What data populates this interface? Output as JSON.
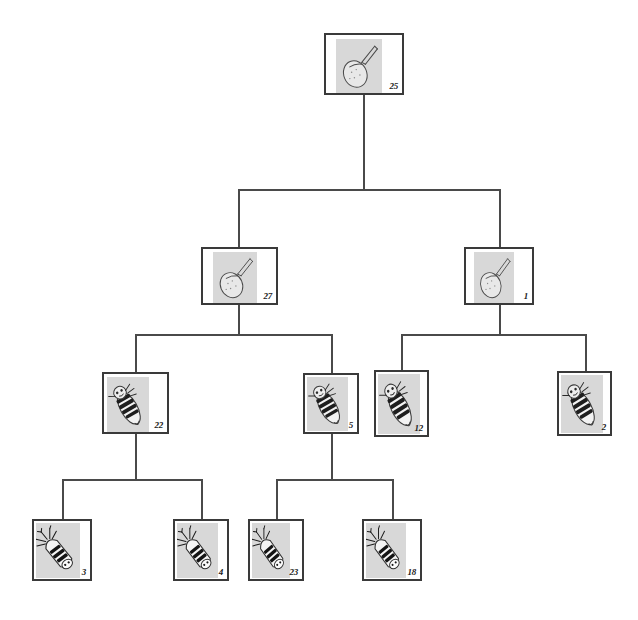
{
  "diagram": {
    "type": "hierarchical-tree",
    "background_color": "#ffffff",
    "line_color": "#4a4a4a",
    "box_border_color": "#3a3a3a",
    "thumb_background_color": "#d8d8d8",
    "levels": 4,
    "node_count": 11
  },
  "nodes": [
    {
      "id": "n25",
      "label": "25",
      "level": 0,
      "icon": "specimen-thumbnail-pupa",
      "x": 324,
      "y": 33,
      "w": 80,
      "h": 62,
      "thumb_x": 10,
      "thumb_y": 4,
      "thumb_w": 46,
      "thumb_h": 54,
      "parent": null
    },
    {
      "id": "n27",
      "label": "27",
      "level": 1,
      "icon": "specimen-thumbnail-pupa",
      "x": 201,
      "y": 247,
      "w": 77,
      "h": 58,
      "thumb_x": 10,
      "thumb_y": 3,
      "thumb_w": 44,
      "thumb_h": 51,
      "parent": "n25"
    },
    {
      "id": "n1",
      "label": "1",
      "level": 1,
      "icon": "specimen-thumbnail-pupa",
      "x": 464,
      "y": 247,
      "w": 70,
      "h": 58,
      "thumb_x": 8,
      "thumb_y": 3,
      "thumb_w": 40,
      "thumb_h": 51,
      "parent": "n25"
    },
    {
      "id": "n22",
      "label": "22",
      "level": 2,
      "icon": "specimen-thumbnail-larva",
      "x": 102,
      "y": 372,
      "w": 67,
      "h": 62,
      "thumb_x": 3,
      "thumb_y": 3,
      "thumb_w": 42,
      "thumb_h": 55,
      "parent": "n27"
    },
    {
      "id": "n5",
      "label": "5",
      "level": 2,
      "icon": "specimen-thumbnail-larva",
      "x": 303,
      "y": 373,
      "w": 56,
      "h": 61,
      "thumb_x": 2,
      "thumb_y": 2,
      "thumb_w": 41,
      "thumb_h": 54,
      "parent": "n27"
    },
    {
      "id": "n12",
      "label": "12",
      "level": 2,
      "icon": "specimen-thumbnail-larva",
      "x": 374,
      "y": 370,
      "w": 55,
      "h": 67,
      "thumb_x": 2,
      "thumb_y": 2,
      "thumb_w": 42,
      "thumb_h": 60,
      "parent": "n1"
    },
    {
      "id": "n2",
      "label": "2",
      "level": 2,
      "icon": "specimen-thumbnail-larva",
      "x": 557,
      "y": 371,
      "w": 55,
      "h": 65,
      "thumb_x": 2,
      "thumb_y": 2,
      "thumb_w": 42,
      "thumb_h": 58,
      "parent": "n1"
    },
    {
      "id": "n3",
      "label": "3",
      "level": 3,
      "icon": "specimen-thumbnail-bomb-larva",
      "x": 32,
      "y": 519,
      "w": 60,
      "h": 62,
      "thumb_x": 2,
      "thumb_y": 2,
      "thumb_w": 44,
      "thumb_h": 55,
      "parent": "n22"
    },
    {
      "id": "n4",
      "label": "4",
      "level": 3,
      "icon": "specimen-thumbnail-bomb-larva",
      "x": 173,
      "y": 519,
      "w": 56,
      "h": 62,
      "thumb_x": 2,
      "thumb_y": 2,
      "thumb_w": 41,
      "thumb_h": 55,
      "parent": "n22"
    },
    {
      "id": "n23",
      "label": "23",
      "level": 3,
      "icon": "specimen-thumbnail-bomb-larva",
      "x": 248,
      "y": 519,
      "w": 56,
      "h": 62,
      "thumb_x": 2,
      "thumb_y": 2,
      "thumb_w": 38,
      "thumb_h": 55,
      "parent": "n5"
    },
    {
      "id": "n18",
      "label": "18",
      "level": 3,
      "icon": "specimen-thumbnail-bomb-larva",
      "x": 362,
      "y": 519,
      "w": 60,
      "h": 62,
      "thumb_x": 2,
      "thumb_y": 2,
      "thumb_w": 40,
      "thumb_h": 55,
      "parent": "n5"
    }
  ],
  "edges": [
    {
      "name": "root-stem",
      "orient": "v",
      "x": 363,
      "y": 95,
      "len": 95
    },
    {
      "name": "level1-bar",
      "orient": "h",
      "x": 238,
      "y": 189,
      "len": 262
    },
    {
      "name": "to-n27",
      "orient": "v",
      "x": 238,
      "y": 189,
      "len": 58
    },
    {
      "name": "to-n1",
      "orient": "v",
      "x": 499,
      "y": 189,
      "len": 58
    },
    {
      "name": "n27-stem",
      "orient": "v",
      "x": 238,
      "y": 305,
      "len": 30
    },
    {
      "name": "level2-bar-left",
      "orient": "h",
      "x": 135,
      "y": 334,
      "len": 196
    },
    {
      "name": "to-n22",
      "orient": "v",
      "x": 135,
      "y": 334,
      "len": 38
    },
    {
      "name": "to-n5",
      "orient": "v",
      "x": 331,
      "y": 334,
      "len": 39
    },
    {
      "name": "n1-stem",
      "orient": "v",
      "x": 499,
      "y": 305,
      "len": 30
    },
    {
      "name": "level2-bar-right",
      "orient": "h",
      "x": 401,
      "y": 334,
      "len": 184
    },
    {
      "name": "to-n12",
      "orient": "v",
      "x": 401,
      "y": 334,
      "len": 36
    },
    {
      "name": "to-n2",
      "orient": "v",
      "x": 585,
      "y": 334,
      "len": 37
    },
    {
      "name": "n22-stem",
      "orient": "v",
      "x": 135,
      "y": 434,
      "len": 45
    },
    {
      "name": "level3-bar-left",
      "orient": "h",
      "x": 62,
      "y": 479,
      "len": 139
    },
    {
      "name": "to-n3",
      "orient": "v",
      "x": 62,
      "y": 479,
      "len": 40
    },
    {
      "name": "to-n4",
      "orient": "v",
      "x": 201,
      "y": 479,
      "len": 40
    },
    {
      "name": "n5-stem",
      "orient": "v",
      "x": 331,
      "y": 434,
      "len": 45
    },
    {
      "name": "level3-bar-right",
      "orient": "h",
      "x": 276,
      "y": 479,
      "len": 116
    },
    {
      "name": "to-n23",
      "orient": "v",
      "x": 276,
      "y": 479,
      "len": 40
    },
    {
      "name": "to-n18",
      "orient": "v",
      "x": 392,
      "y": 479,
      "len": 40
    }
  ]
}
